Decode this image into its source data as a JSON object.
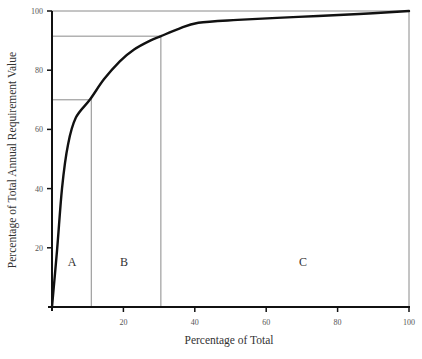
{
  "chart_data": {
    "type": "line",
    "title": "",
    "xlabel": "Percentage of Total",
    "ylabel": "Percentage of Total Annual Requirement Value",
    "xlim": [
      0,
      100
    ],
    "ylim": [
      0,
      100
    ],
    "grid": false,
    "x_ticks": [
      20,
      40,
      60,
      80,
      100
    ],
    "y_ticks": [
      20,
      40,
      60,
      80,
      100
    ],
    "series": [
      {
        "name": "Cumulative requirement value (ABC curve)",
        "x": [
          0,
          1.4,
          2.8,
          4.5,
          6.7,
          10.6,
          14.6,
          19,
          23,
          27.5,
          30.5,
          35.5,
          41,
          52,
          69,
          86,
          100
        ],
        "y": [
          0,
          19,
          40,
          55,
          64,
          70,
          77,
          83,
          87,
          90,
          91.5,
          94,
          96,
          97,
          98,
          99,
          100
        ]
      }
    ],
    "reference_lines": {
      "horizontal": [
        70,
        91.5,
        100
      ],
      "vertical": [
        11,
        30.5,
        100
      ]
    },
    "annotations": [
      {
        "text": "A",
        "x": 5.6,
        "y": 14
      },
      {
        "text": "B",
        "x": 20.2,
        "y": 14
      },
      {
        "text": "C",
        "x": 70.3,
        "y": 14
      }
    ],
    "legend": null
  },
  "colors": {
    "curve": "#111111",
    "axis": "#111111",
    "reference_line": "#8a8a8a",
    "background": "#ffffff"
  }
}
